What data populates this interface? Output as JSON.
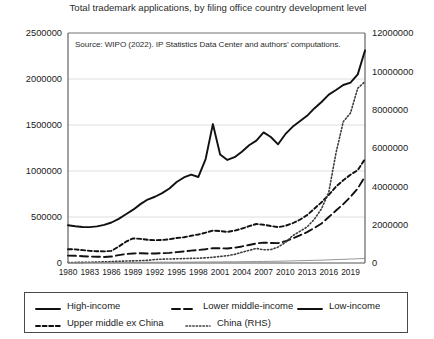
{
  "title": "Total trademark applications, by filing office country development level",
  "source_note": "Source: WIPO (2022). IP Statistics Data Center and authors’ computations.",
  "axes": {
    "left_ticks": [
      "0",
      "500000",
      "1000000",
      "1500000",
      "2000000",
      "2500000"
    ],
    "right_ticks": [
      "0",
      "2000000",
      "4000000",
      "6000000",
      "8000000",
      "10000000",
      "12000000"
    ],
    "x_ticks": [
      "1980",
      "1983",
      "1986",
      "1989",
      "1992",
      "1995",
      "1998",
      "2001",
      "2004",
      "2007",
      "2010",
      "2013",
      "2016",
      "2019"
    ]
  },
  "legend": {
    "items": [
      {
        "label": "High-income",
        "style": "solid",
        "width": 1.9,
        "color": "#111111"
      },
      {
        "label": "Lower middle-income",
        "style": "dashed-long",
        "width": 1.9,
        "color": "#111111"
      },
      {
        "label": "Low-income",
        "style": "solid",
        "width": 0.9,
        "color": "#8a8a8a"
      },
      {
        "label": "Upper middle ex China",
        "style": "dashed-short",
        "width": 1.9,
        "color": "#111111"
      },
      {
        "label": "China (RHS)",
        "style": "dotted",
        "width": 1.6,
        "color": "#444444"
      }
    ]
  },
  "chart_data": {
    "type": "line",
    "title": "Total trademark applications, by filing office country development level",
    "xlabel": "",
    "ylabel": "",
    "grid": true,
    "legend_position": "bottom",
    "xlim": [
      1980,
      2021
    ],
    "ylim": [
      0,
      2500000
    ],
    "y2lim": [
      0,
      12000000
    ],
    "x": [
      1980,
      1981,
      1982,
      1983,
      1984,
      1985,
      1986,
      1987,
      1988,
      1989,
      1990,
      1991,
      1992,
      1993,
      1994,
      1995,
      1996,
      1997,
      1998,
      1999,
      2000,
      2001,
      2002,
      2003,
      2004,
      2005,
      2006,
      2007,
      2008,
      2009,
      2010,
      2011,
      2012,
      2013,
      2014,
      2015,
      2016,
      2017,
      2018,
      2019,
      2020,
      2021
    ],
    "series": [
      {
        "name": "High-income",
        "axis": "left",
        "style": "solid",
        "values": [
          410000,
          400000,
          392000,
          390000,
          398000,
          415000,
          440000,
          480000,
          530000,
          580000,
          640000,
          690000,
          720000,
          760000,
          810000,
          880000,
          930000,
          960000,
          935000,
          1130000,
          1510000,
          1180000,
          1120000,
          1150000,
          1210000,
          1280000,
          1330000,
          1420000,
          1370000,
          1290000,
          1400000,
          1480000,
          1540000,
          1600000,
          1680000,
          1750000,
          1830000,
          1880000,
          1935000,
          1960000,
          2050000,
          2310000
        ]
      },
      {
        "name": "Upper middle ex China",
        "axis": "left",
        "style": "dashed-short",
        "values": [
          150000,
          148000,
          140000,
          132000,
          128000,
          126000,
          132000,
          178000,
          232000,
          268000,
          262000,
          252000,
          248000,
          250000,
          258000,
          272000,
          280000,
          296000,
          310000,
          330000,
          352000,
          348000,
          338000,
          352000,
          374000,
          400000,
          424000,
          416000,
          402000,
          390000,
          404000,
          432000,
          470000,
          520000,
          590000,
          660000,
          740000,
          830000,
          900000,
          960000,
          1010000,
          1130000
        ]
      },
      {
        "name": "Lower middle-income",
        "axis": "left",
        "style": "dashed-long",
        "values": [
          80000,
          78000,
          74000,
          70000,
          68000,
          66000,
          70000,
          86000,
          98000,
          104000,
          106000,
          104000,
          104000,
          106000,
          110000,
          118000,
          126000,
          134000,
          142000,
          150000,
          162000,
          160000,
          158000,
          166000,
          180000,
          196000,
          212000,
          222000,
          218000,
          216000,
          236000,
          268000,
          300000,
          336000,
          380000,
          430000,
          500000,
          570000,
          640000,
          720000,
          810000,
          940000
        ]
      },
      {
        "name": "China (RHS)",
        "axis": "right",
        "style": "dotted",
        "values": [
          26000,
          30000,
          34000,
          40000,
          48000,
          60000,
          74000,
          90000,
          104000,
          112000,
          122000,
          140000,
          180000,
          200000,
          210000,
          220000,
          230000,
          240000,
          250000,
          270000,
          300000,
          340000,
          380000,
          450000,
          560000,
          660000,
          760000,
          690000,
          700000,
          830000,
          1070000,
          1420000,
          1650000,
          1880000,
          2280000,
          2830000,
          3700000,
          5750000,
          7370000,
          7830000,
          9120000,
          9460000
        ]
      },
      {
        "name": "Low-income",
        "axis": "left",
        "style": "solid-thin",
        "values": [
          6000,
          6000,
          6000,
          6000,
          6000,
          6000,
          6000,
          7000,
          7000,
          7000,
          8000,
          8000,
          8000,
          9000,
          9000,
          9000,
          10000,
          10000,
          11000,
          11000,
          12000,
          12000,
          13000,
          13000,
          14000,
          15000,
          16000,
          17000,
          18000,
          19000,
          21000,
          23000,
          25000,
          27000,
          29000,
          31000,
          34000,
          37000,
          40000,
          43000,
          46000,
          50000
        ]
      }
    ]
  }
}
